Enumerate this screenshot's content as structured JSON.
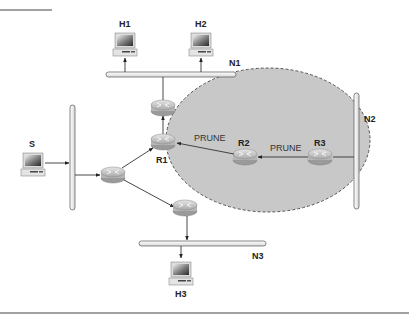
{
  "diagram": {
    "colors": {
      "background": "#ffffff",
      "prune_region_fill": "#c8c8c8",
      "prune_region_border": "#555555",
      "bus_fill": "#f4f4f4",
      "bus_stroke": "#555555",
      "router_fill": "#c9c9c9",
      "link": "#333333"
    },
    "nodes": {
      "source": {
        "label": "S"
      },
      "hosts": [
        {
          "id": "H1",
          "label": "H1"
        },
        {
          "id": "H2",
          "label": "H2"
        },
        {
          "id": "H3",
          "label": "H3"
        }
      ],
      "networks": [
        {
          "id": "N1",
          "label": "N1"
        },
        {
          "id": "N2",
          "label": "N2"
        },
        {
          "id": "N3",
          "label": "N3"
        }
      ],
      "routers": [
        {
          "id": "R1",
          "label": "R1"
        },
        {
          "id": "R2",
          "label": "R2"
        },
        {
          "id": "R3",
          "label": "R3"
        }
      ]
    },
    "messages": [
      {
        "from": "R2",
        "to": "R1",
        "label": "PRUNE"
      },
      {
        "from": "R3",
        "to": "R2",
        "label": "PRUNE"
      }
    ]
  }
}
